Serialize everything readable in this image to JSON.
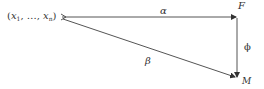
{
  "diagram": {
    "type": "commutative-diagram",
    "nodes": {
      "source": {
        "prefix": "(",
        "var1": "x",
        "sub1": "1",
        "sep": ", …, ",
        "var2": "x",
        "sub2": "n",
        "suffix": ")"
      },
      "top_right": "F",
      "bottom_right": "M"
    },
    "arrows": {
      "top": {
        "label": "α",
        "from": "source",
        "to": "F"
      },
      "right": {
        "label": "ϕ",
        "from": "F",
        "to": "M"
      },
      "diagonal": {
        "label": "β",
        "from": "source",
        "to": "M"
      }
    },
    "colors": {
      "line": "#555555",
      "text": "#333333",
      "background": "#ffffff"
    }
  }
}
